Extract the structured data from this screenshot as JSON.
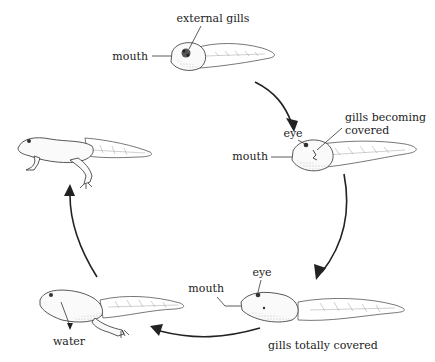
{
  "stages": [
    {
      "name": "stage-1-external-gills",
      "labels": {
        "top": "external gills",
        "left": "mouth"
      }
    },
    {
      "name": "stage-2-gills-becoming-covered",
      "labels": {
        "eye": "eye",
        "gills_line1": "gills becoming",
        "gills_line2": "covered",
        "mouth": "mouth"
      }
    },
    {
      "name": "stage-3-gills-totally-covered",
      "labels": {
        "eye": "eye",
        "mouth": "mouth",
        "bottom": "gills totally covered"
      }
    },
    {
      "name": "stage-4-hind-legs",
      "labels": {
        "water": "water"
      }
    },
    {
      "name": "stage-5-froglet",
      "labels": {}
    }
  ],
  "cycle_direction": "clockwise"
}
